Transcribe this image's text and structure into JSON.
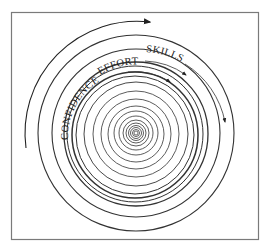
{
  "figure": {
    "labels": {
      "skills": "SKILLS",
      "effort": "EFFORT",
      "confidence": "CONFIDENCE"
    },
    "colors": {
      "line": "#333333",
      "frame": "#7a7a7a",
      "background": "#ffffff"
    },
    "center": [
      136,
      133
    ],
    "ring_count": 18
  }
}
